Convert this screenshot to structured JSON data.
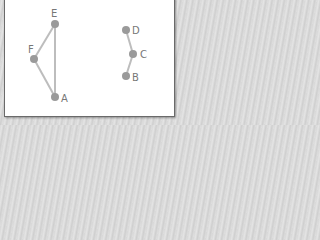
{
  "diagram": {
    "type": "graph",
    "colors": {
      "node": "#9a9a9a",
      "edge": "#bdbdbd",
      "label": "#777777",
      "panel": "#ffffff"
    },
    "nodes": [
      {
        "id": "E",
        "label": "E",
        "x": 55,
        "y": 24,
        "label_pos": "top"
      },
      {
        "id": "F",
        "label": "F",
        "x": 34,
        "y": 59,
        "label_pos": "top-left"
      },
      {
        "id": "A",
        "label": "A",
        "x": 55,
        "y": 97,
        "label_pos": "right"
      },
      {
        "id": "D",
        "label": "D",
        "x": 126,
        "y": 30,
        "label_pos": "right"
      },
      {
        "id": "C",
        "label": "C",
        "x": 133,
        "y": 54,
        "label_pos": "right"
      },
      {
        "id": "B",
        "label": "B",
        "x": 126,
        "y": 76,
        "label_pos": "right"
      }
    ],
    "edges": [
      {
        "from": "E",
        "to": "F"
      },
      {
        "from": "E",
        "to": "A"
      },
      {
        "from": "F",
        "to": "A"
      },
      {
        "from": "D",
        "to": "C"
      },
      {
        "from": "C",
        "to": "B"
      }
    ]
  }
}
